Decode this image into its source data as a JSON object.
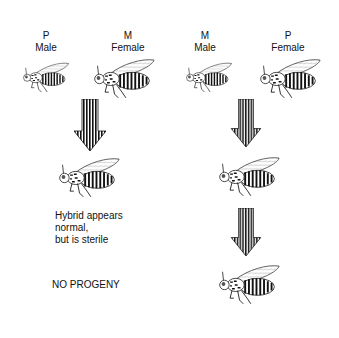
{
  "left_cross": {
    "parent1": {
      "strain": "P",
      "sex": "Male"
    },
    "parent2": {
      "strain": "M",
      "sex": "Female"
    },
    "note_lines": [
      "Hybrid appears",
      "normal,",
      "but is sterile"
    ],
    "outcome": "NO PROGENY"
  },
  "right_cross": {
    "parent1": {
      "strain": "M",
      "sex": "Male"
    },
    "parent2": {
      "strain": "P",
      "sex": "Female"
    }
  },
  "icons": {
    "fly": "fly-icon",
    "arrow": "striped-down-arrow-icon"
  }
}
